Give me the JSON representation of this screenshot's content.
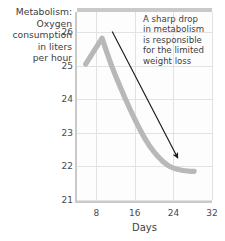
{
  "chart_data": {
    "type": "line",
    "title": "",
    "ylabel": "Metabolism:\nOxygen\nconsumption\nin liters\nper hour",
    "xlabel": "Days",
    "xlim": [
      4,
      32
    ],
    "ylim": [
      21,
      26.6
    ],
    "grid": true,
    "legend": null,
    "xticks": [
      8,
      16,
      24,
      32
    ],
    "xtick_labels": [
      "8",
      "16",
      "24",
      "32"
    ],
    "yticks": [
      21,
      22,
      23,
      24,
      25,
      26
    ],
    "ytick_labels": [
      "21",
      "22",
      "23",
      "24",
      "25",
      "26"
    ],
    "series": [
      {
        "name": "Oxygen consumption",
        "color": "#b8b8b8",
        "x": [
          5.8,
          9.2,
          11.0,
          13.0,
          15.0,
          17.0,
          19.0,
          21.0,
          23.0,
          25.0,
          27.0,
          28.3
        ],
        "values": [
          25.05,
          25.82,
          25.05,
          24.35,
          23.7,
          23.1,
          22.6,
          22.25,
          22.0,
          21.9,
          21.86,
          21.85
        ]
      }
    ],
    "annotations": [
      {
        "text": "A sharp drop\nin metabolism\nis responsible\nfor the limited\nweight loss",
        "arrow_from": [
          11.3,
          26.02
        ],
        "arrow_to": [
          24.9,
          22.25
        ],
        "arrow_color": "#1a1a1a"
      }
    ]
  },
  "labels": {
    "y_axis_title": "Metabolism:\nOxygen\nconsumption\nin liters\nper hour",
    "x_axis_title": "Days",
    "annotation": "A sharp drop\nin metabolism\nis responsible\nfor the limited\nweight loss"
  },
  "colors": {
    "curve": "#b8b8b8",
    "grid": "#e2e2e2",
    "axis": "#c9c9c9",
    "text": "#3d3d3d",
    "arrow": "#1a1a1a"
  }
}
